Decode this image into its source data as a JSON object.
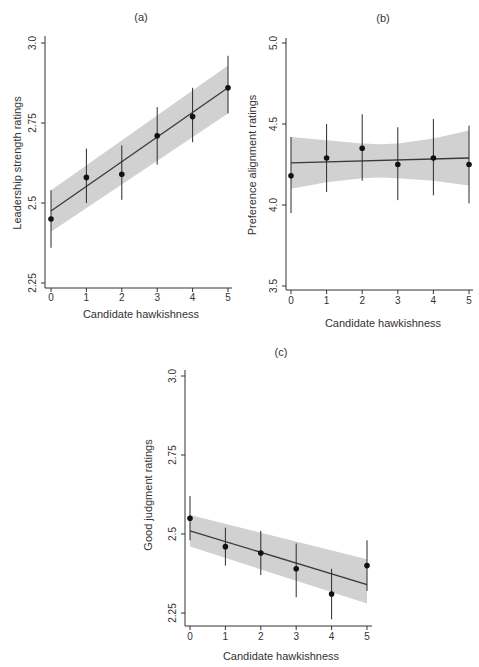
{
  "figure": {
    "panels": [
      {
        "id": "a",
        "title": "(a)",
        "xlabel": "Candidate hawkishness",
        "ylabel": "Leadership strength ratings"
      },
      {
        "id": "b",
        "title": "(b)",
        "xlabel": "Candidate hawkishness",
        "ylabel": "Preference alignment ratings"
      },
      {
        "id": "c",
        "title": "(c)",
        "xlabel": "Candidate hawkishness",
        "ylabel": "Good judgment ratings"
      }
    ]
  },
  "chart_data": [
    {
      "type": "scatter",
      "title": "(a)",
      "xlabel": "Candidate hawkishness",
      "ylabel": "Leadership strength ratings",
      "x": [
        0,
        1,
        2,
        3,
        4,
        5
      ],
      "x_ticks": [
        "0",
        "1",
        "2",
        "3",
        "4",
        "5"
      ],
      "y_ticks": [
        "2.25",
        "2.5",
        "2.75",
        "3.0"
      ],
      "y_tick_values": [
        2.25,
        2.5,
        2.75,
        3.0
      ],
      "xlim": [
        0,
        5
      ],
      "ylim": [
        2.25,
        3.0
      ],
      "series": [
        {
          "name": "means",
          "values": [
            2.45,
            2.58,
            2.59,
            2.71,
            2.77,
            2.86
          ],
          "ci_low": [
            2.36,
            2.5,
            2.51,
            2.62,
            2.69,
            2.78
          ],
          "ci_high": [
            2.54,
            2.67,
            2.68,
            2.8,
            2.86,
            2.96
          ]
        }
      ],
      "fit": {
        "y_at_xmin": 2.475,
        "y_at_xmax": 2.86
      },
      "fit_band": {
        "low": [
          2.41,
          2.78
        ],
        "high": [
          2.54,
          2.93
        ]
      },
      "grid": false,
      "legend": false
    },
    {
      "type": "scatter",
      "title": "(b)",
      "xlabel": "Candidate hawkishness",
      "ylabel": "Preference alignment ratings",
      "x": [
        0,
        1,
        2,
        3,
        4,
        5
      ],
      "x_ticks": [
        "0",
        "1",
        "2",
        "3",
        "4",
        "5"
      ],
      "y_ticks": [
        "3.5",
        "4.0",
        "4.5",
        "5.0"
      ],
      "y_tick_values": [
        3.5,
        4.0,
        4.5,
        5.0
      ],
      "xlim": [
        0,
        5
      ],
      "ylim": [
        3.5,
        5.0
      ],
      "series": [
        {
          "name": "means",
          "values": [
            4.18,
            4.29,
            4.35,
            4.25,
            4.29,
            4.25
          ],
          "ci_low": [
            3.95,
            4.08,
            4.15,
            4.03,
            4.06,
            4.01
          ],
          "ci_high": [
            4.42,
            4.5,
            4.56,
            4.48,
            4.53,
            4.49
          ]
        }
      ],
      "fit": {
        "y_at_xmin": 4.26,
        "y_at_xmax": 4.29
      },
      "fit_band": {
        "x": [
          0,
          1,
          2,
          2.5,
          3,
          4,
          5
        ],
        "low": [
          4.1,
          4.14,
          4.165,
          4.17,
          4.165,
          4.15,
          4.12
        ],
        "high": [
          4.42,
          4.4,
          4.38,
          4.375,
          4.38,
          4.41,
          4.46
        ]
      },
      "grid": false,
      "legend": false
    },
    {
      "type": "scatter",
      "title": "(c)",
      "xlabel": "Candidate hawkishness",
      "ylabel": "Good judgment ratings",
      "x": [
        0,
        1,
        2,
        3,
        4,
        5
      ],
      "x_ticks": [
        "0",
        "1",
        "2",
        "3",
        "4",
        "5"
      ],
      "y_ticks": [
        "2.25",
        "2.5",
        "2.75",
        "3.0"
      ],
      "y_tick_values": [
        2.25,
        2.5,
        2.75,
        3.0
      ],
      "xlim": [
        0,
        5
      ],
      "ylim": [
        2.25,
        3.0
      ],
      "series": [
        {
          "name": "means",
          "values": [
            2.55,
            2.46,
            2.44,
            2.39,
            2.31,
            2.4
          ],
          "ci_low": [
            2.48,
            2.4,
            2.37,
            2.3,
            2.23,
            2.32
          ],
          "ci_high": [
            2.62,
            2.52,
            2.51,
            2.47,
            2.39,
            2.48
          ]
        }
      ],
      "fit": {
        "y_at_xmin": 2.51,
        "y_at_xmax": 2.34
      },
      "fit_band": {
        "low": [
          2.46,
          2.28
        ],
        "high": [
          2.56,
          2.42
        ]
      },
      "grid": false,
      "legend": false
    }
  ]
}
